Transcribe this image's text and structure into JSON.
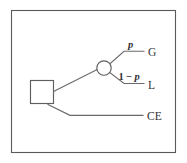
{
  "figure": {
    "type": "decision-tree",
    "background_color": "#ffffff",
    "frame_color": "#5a5a5c",
    "line_color": "#6a6a6e",
    "text_color": "#323234"
  },
  "nodes": {
    "decision": {
      "name": "decision-node",
      "shape": "square",
      "label": "",
      "x": 30,
      "y": 80,
      "width": 23,
      "height": 23
    },
    "chance": {
      "name": "chance-node",
      "shape": "circle",
      "label": "",
      "cx": 104,
      "cy": 68,
      "r": 7.2
    }
  },
  "branches": [
    {
      "id": "gamble-branch",
      "from": "decision",
      "to": "chance",
      "probability_label": "",
      "outcome_label": ""
    },
    {
      "id": "gain-branch",
      "from": "chance",
      "probability_label": "p",
      "outcome_label": "G"
    },
    {
      "id": "loss-branch",
      "from": "chance",
      "probability_label_prefix": "1",
      "probability_label_operator": " − ",
      "probability_label_variable": "p",
      "probability_label": "1 − p",
      "outcome_label": "L"
    },
    {
      "id": "certainty-branch",
      "from": "decision",
      "probability_label": "",
      "outcome_label": "CE"
    }
  ],
  "labels": {
    "prob_gain": "p",
    "prob_loss_prefix": "1",
    "prob_loss_operator": "−",
    "prob_loss_variable": "p",
    "outcome_gain": "G",
    "outcome_loss": "L",
    "outcome_certainty": "CE"
  }
}
